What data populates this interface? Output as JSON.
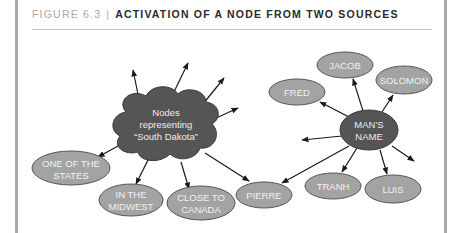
{
  "figure": {
    "number": "FIGURE 6.3",
    "separator": "|",
    "title": "ACTIVATION OF A NODE FROM TWO SOURCES"
  },
  "colors": {
    "dark_node": "#555555",
    "light_node": "#a3a3a3",
    "node_text": "#f2f2f2",
    "edge": "#1a1a1a",
    "frame": "#a9a9a9"
  },
  "diagram": {
    "source_nodes": [
      {
        "id": "south-dakota",
        "lines": [
          "Nodes",
          "representing",
          "“South Dakota”"
        ],
        "shape": "cloud"
      },
      {
        "id": "mans-name",
        "lines": [
          "MAN'S",
          "NAME"
        ],
        "shape": "ellipse"
      }
    ],
    "target_nodes": [
      {
        "id": "one-of-the-states",
        "lines": [
          "ONE OF THE",
          "STATES"
        ]
      },
      {
        "id": "in-the-midwest",
        "lines": [
          "IN THE",
          "MIDWEST"
        ]
      },
      {
        "id": "close-to-canada",
        "lines": [
          "CLOSE TO",
          "CANADA"
        ]
      },
      {
        "id": "pierre",
        "lines": [
          "PIERRE"
        ]
      },
      {
        "id": "fred",
        "lines": [
          "FRED"
        ]
      },
      {
        "id": "jacob",
        "lines": [
          "JACOB"
        ]
      },
      {
        "id": "solomon",
        "lines": [
          "SOLOMON"
        ]
      },
      {
        "id": "tranh",
        "lines": [
          "TRANH"
        ]
      },
      {
        "id": "luis",
        "lines": [
          "LUIS"
        ]
      }
    ],
    "edges": [
      {
        "from": "south-dakota",
        "to": "one-of-the-states"
      },
      {
        "from": "south-dakota",
        "to": "in-the-midwest"
      },
      {
        "from": "south-dakota",
        "to": "close-to-canada"
      },
      {
        "from": "south-dakota",
        "to": "pierre"
      },
      {
        "from": "south-dakota",
        "to": null
      },
      {
        "from": "south-dakota",
        "to": null
      },
      {
        "from": "south-dakota",
        "to": null
      },
      {
        "from": "south-dakota",
        "to": null
      },
      {
        "from": "mans-name",
        "to": "pierre"
      },
      {
        "from": "mans-name",
        "to": "fred"
      },
      {
        "from": "mans-name",
        "to": "jacob"
      },
      {
        "from": "mans-name",
        "to": "solomon"
      },
      {
        "from": "mans-name",
        "to": "tranh"
      },
      {
        "from": "mans-name",
        "to": "luis"
      },
      {
        "from": "mans-name",
        "to": null
      },
      {
        "from": "mans-name",
        "to": null
      }
    ]
  }
}
